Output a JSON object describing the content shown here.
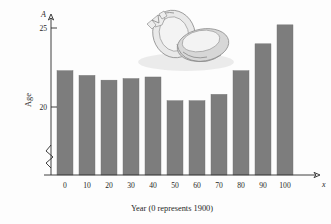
{
  "chart_data": {
    "type": "bar",
    "title": "",
    "subtitle": "",
    "xlabel": "Year (0 represents 1900)",
    "ylabel": "Age",
    "x_axis_symbol": "x",
    "y_axis_symbol": "A",
    "categories": [
      "0",
      "10",
      "20",
      "30",
      "40",
      "50",
      "60",
      "70",
      "80",
      "90",
      "100"
    ],
    "values": [
      22.3,
      22.0,
      21.7,
      21.8,
      21.9,
      20.4,
      20.4,
      20.8,
      22.3,
      24.0,
      25.2
    ],
    "ytick_labels": [
      "20",
      "25"
    ],
    "ytick_values": [
      20,
      25
    ],
    "xtick_labels": [
      "0",
      "10",
      "20",
      "30",
      "40",
      "50",
      "60",
      "70",
      "80",
      "90",
      "100"
    ],
    "ylim": [
      19.0,
      25.8
    ],
    "xlim": [
      -0.5,
      10.5
    ],
    "grid": false,
    "legend": false,
    "axis_break": true,
    "bar_color": "#7d7d7d",
    "axis_color": "#2b2b2b",
    "background_color": "#fdfdfd"
  },
  "illustration": {
    "name": "wedding-rings",
    "description": "Two wedding rings, one with a diamond solitaire, resting with a soft shadow",
    "colors": {
      "outline": "#8d8d8d",
      "fill_light": "#e9e9e9",
      "fill_mid": "#d7d7d7",
      "shadow": "#dcdcdc"
    }
  }
}
